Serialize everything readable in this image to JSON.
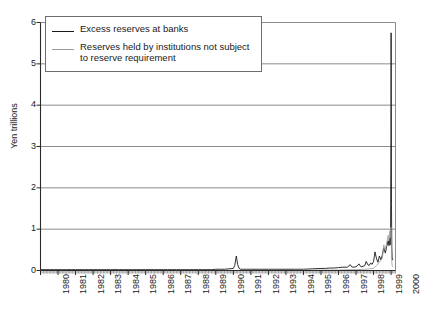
{
  "chart_data": {
    "type": "line",
    "title": "",
    "xlabel": "",
    "ylabel": "Yen trillions",
    "ylim": [
      0,
      6
    ],
    "xlim": [
      1980,
      2000.25
    ],
    "y_ticks": [
      0,
      1,
      2,
      3,
      4,
      5,
      6
    ],
    "y_tick_labels": [
      "0",
      "1",
      "2",
      "3",
      "4",
      "5",
      "6"
    ],
    "x_ticks": [
      1980,
      1981,
      1982,
      1983,
      1984,
      1985,
      1986,
      1987,
      1988,
      1989,
      1990,
      1991,
      1992,
      1993,
      1994,
      1995,
      1996,
      1997,
      1998,
      1999,
      2000
    ],
    "x_tick_labels": [
      "1980",
      "1981",
      "1982",
      "1983",
      "1984",
      "1985",
      "1986",
      "1987",
      "1988",
      "1989",
      "1990",
      "1991",
      "1992",
      "1993",
      "1994",
      "1995",
      "1996",
      "1997",
      "1998",
      "1999",
      "2000"
    ],
    "grid": true,
    "minor_ticks": "monthly",
    "legend_position": "upper-left",
    "legend": [
      {
        "label": "Excess reserves at banks",
        "color": "#1a1a1a"
      },
      {
        "label": "Reserves held by institutions not subject to reserve requirement",
        "color": "#9a9a9a"
      }
    ],
    "series": [
      {
        "name": "Excess reserves at banks",
        "color": "#1a1a1a",
        "x": [
          1980.0,
          1980.25,
          1980.5,
          1980.75,
          1981.0,
          1981.25,
          1981.5,
          1981.75,
          1982.0,
          1982.25,
          1982.5,
          1982.75,
          1983.0,
          1983.25,
          1983.5,
          1983.75,
          1984.0,
          1984.25,
          1984.5,
          1984.75,
          1985.0,
          1985.25,
          1985.5,
          1985.75,
          1986.0,
          1986.25,
          1986.5,
          1986.75,
          1987.0,
          1987.25,
          1987.5,
          1987.75,
          1988.0,
          1988.25,
          1988.5,
          1988.75,
          1989.0,
          1989.25,
          1989.5,
          1989.75,
          1990.0,
          1990.25,
          1990.5,
          1990.75,
          1991.0,
          1991.08,
          1991.17,
          1991.25,
          1991.33,
          1991.42,
          1991.5,
          1991.75,
          1992.0,
          1992.5,
          1993.0,
          1993.5,
          1994.0,
          1994.5,
          1995.0,
          1995.5,
          1996.0,
          1996.25,
          1996.5,
          1996.75,
          1997.0,
          1997.25,
          1997.5,
          1997.67,
          1997.75,
          1997.83,
          1998.0,
          1998.17,
          1998.25,
          1998.33,
          1998.5,
          1998.58,
          1998.67,
          1998.75,
          1998.83,
          1998.92,
          1999.0,
          1999.08,
          1999.17,
          1999.25,
          1999.33,
          1999.42,
          1999.5,
          1999.58,
          1999.67,
          1999.75,
          1999.83,
          1999.88,
          1999.92,
          1999.95,
          1999.97,
          1999.99,
          2000.0,
          2000.02,
          2000.04,
          2000.06,
          2000.1
        ],
        "y": [
          0.02,
          0.02,
          0.02,
          0.02,
          0.02,
          0.02,
          0.02,
          0.02,
          0.02,
          0.02,
          0.02,
          0.02,
          0.02,
          0.02,
          0.02,
          0.02,
          0.02,
          0.02,
          0.02,
          0.02,
          0.02,
          0.02,
          0.02,
          0.02,
          0.02,
          0.02,
          0.02,
          0.02,
          0.02,
          0.02,
          0.02,
          0.02,
          0.02,
          0.02,
          0.02,
          0.02,
          0.02,
          0.02,
          0.02,
          0.02,
          0.03,
          0.03,
          0.03,
          0.04,
          0.05,
          0.12,
          0.35,
          0.14,
          0.05,
          0.03,
          0.03,
          0.03,
          0.03,
          0.03,
          0.03,
          0.03,
          0.03,
          0.03,
          0.03,
          0.04,
          0.05,
          0.05,
          0.06,
          0.06,
          0.07,
          0.08,
          0.08,
          0.14,
          0.09,
          0.08,
          0.09,
          0.16,
          0.1,
          0.09,
          0.12,
          0.22,
          0.14,
          0.12,
          0.18,
          0.15,
          0.22,
          0.45,
          0.28,
          0.2,
          0.35,
          0.26,
          0.38,
          0.55,
          0.42,
          0.58,
          0.72,
          0.6,
          0.78,
          0.62,
          0.9,
          3.2,
          5.75,
          1.6,
          0.55,
          0.3,
          0.25
        ]
      },
      {
        "name": "Reserves held by institutions not subject to reserve requirement",
        "color": "#9a9a9a",
        "x": [
          1980.0,
          1985.0,
          1990.0,
          1992.0,
          1994.0,
          1996.0,
          1997.0,
          1997.5,
          1998.0,
          1998.5,
          1998.75,
          1999.0,
          1999.17,
          1999.33,
          1999.5,
          1999.58,
          1999.67,
          1999.75,
          1999.83,
          1999.88,
          1999.92,
          1999.95,
          1999.97,
          1999.99,
          2000.0,
          2000.02,
          2000.04,
          2000.06,
          2000.1
        ],
        "y": [
          0.0,
          0.0,
          0.0,
          0.0,
          0.0,
          0.01,
          0.01,
          0.02,
          0.02,
          0.03,
          0.04,
          0.05,
          0.12,
          0.2,
          0.3,
          0.62,
          0.5,
          0.68,
          0.85,
          0.72,
          0.95,
          0.8,
          1.0,
          1.05,
          1.0,
          0.45,
          0.2,
          0.12,
          0.08
        ]
      }
    ]
  },
  "axis": {
    "y_title": "Yen trillions"
  }
}
